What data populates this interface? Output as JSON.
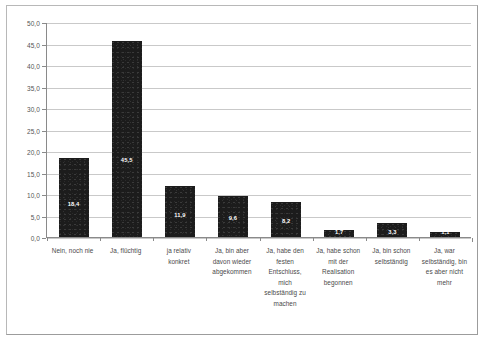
{
  "chart_data": {
    "type": "bar",
    "title": "",
    "subtitle": "",
    "xlabel": "",
    "ylabel": "",
    "ylim": [
      0.0,
      50.0
    ],
    "ytick_step": 5.0,
    "grid": true,
    "legend": false,
    "legend_position": "none",
    "decimal_separator": ",",
    "bar_color": "#1c1c1c",
    "gridline_color": "#c9c9c9",
    "axis_color": "#8a8a8a",
    "label_color": "#555555",
    "value_label_color": "#ffffff",
    "ytick_labels": [
      "50,0",
      "45,0",
      "40,0",
      "35,0",
      "30,0",
      "25,0",
      "20,0",
      "15,0",
      "10,0",
      "5,0",
      "0,0"
    ],
    "ytick_values": [
      50.0,
      45.0,
      40.0,
      35.0,
      30.0,
      25.0,
      20.0,
      15.0,
      10.0,
      5.0,
      0.0
    ],
    "categories": [
      "Nein, noch nie",
      "Ja, flüchtig",
      "ja relativ konkret",
      "Ja, bin aber davon wieder abgekommen",
      "Ja, habe den festen Entschluss, mich selbständig zu machen",
      "Ja, habe schon mit der Realisation begonnen",
      "Ja, bin schon selbständig",
      "Ja, war selbständig, bin es aber nicht mehr"
    ],
    "values": [
      18.4,
      45.5,
      11.9,
      9.6,
      8.2,
      1.7,
      3.3,
      1.1
    ],
    "value_labels": [
      "18,4",
      "45,5",
      "11,9",
      "9,6",
      "8,2",
      "1,7",
      "3,3",
      "1,1"
    ]
  }
}
